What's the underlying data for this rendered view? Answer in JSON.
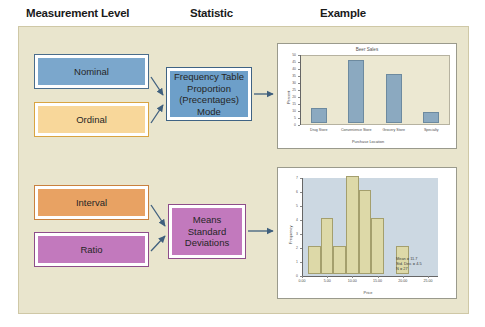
{
  "headers": {
    "measurement_level": "Measurement Level",
    "statistic": "Statistic",
    "example": "Example"
  },
  "colors": {
    "panel_background": "#e9e5cd",
    "nominal": "#7ba7cc",
    "ordinal": "#f8d79a",
    "interval": "#e8a263",
    "ratio": "#c279bd",
    "frequency_box": "#6d9fc9",
    "means_box": "#c279bd",
    "arrow": "#3f5f7d",
    "bar_fill": "#8ba9c0",
    "hist_fill": "#ddd9a8",
    "hist_plot_background": "#ccd8e2"
  },
  "levels": [
    {
      "id": "nominal",
      "label": "Nominal"
    },
    {
      "id": "ordinal",
      "label": "Ordinal"
    },
    {
      "id": "interval",
      "label": "Interval"
    },
    {
      "id": "ratio",
      "label": "Ratio"
    }
  ],
  "statistics": {
    "categorical": {
      "line1": "Frequency Table",
      "line2": "Proportion",
      "line3": "(Precentages) Mode"
    },
    "continuous": {
      "line1": "Means",
      "line2": "Standard",
      "line3": "Deviations"
    }
  },
  "chart_data": [
    {
      "type": "bar",
      "title": "Beer Sales",
      "xlabel": "Purchase Location",
      "ylabel": "Percent",
      "categories": [
        "Drug Store",
        "Convenience Store",
        "Grocery Store",
        "Specialty"
      ],
      "values": [
        11,
        45,
        35,
        8
      ],
      "ylim": [
        0,
        50
      ],
      "yticks": [
        0,
        5,
        10,
        15,
        20,
        25,
        30,
        35,
        40,
        45,
        50
      ],
      "grid": false,
      "legend": "none"
    },
    {
      "type": "bar",
      "subtype": "histogram",
      "title": "",
      "xlabel": "Price",
      "ylabel": "Frequency",
      "bin_centers": [
        2.5,
        5.0,
        7.5,
        10.0,
        12.5,
        15.0,
        17.5,
        20.0
      ],
      "values": [
        2,
        4,
        2,
        7,
        6,
        4,
        0,
        2
      ],
      "ylim": [
        0,
        7
      ],
      "yticks": [
        0,
        1,
        2,
        3,
        4,
        5,
        6,
        7
      ],
      "xlim": [
        0,
        27
      ],
      "xticks": [
        "0.00",
        "5.00",
        "10.00",
        "15.00",
        "20.00",
        "25.00"
      ],
      "xtick_values": [
        0,
        5,
        10,
        15,
        20,
        25
      ],
      "overlay": "normal-curve",
      "annotations": {
        "mean": "Mean = 11.7",
        "std_dev": "Std. Dev. = 4.5",
        "n": "N = 27"
      },
      "grid": false,
      "legend": "none"
    }
  ]
}
